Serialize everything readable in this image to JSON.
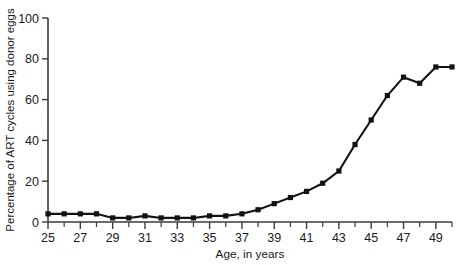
{
  "chart_data": {
    "type": "line",
    "title": "",
    "xlabel": "Age, in years",
    "ylabel": "Percentage of ART cycles using donor eggs",
    "xlim": [
      25,
      50
    ],
    "ylim": [
      0,
      100
    ],
    "xticks": [
      25,
      27,
      29,
      31,
      33,
      35,
      37,
      39,
      41,
      43,
      45,
      47,
      49
    ],
    "xtick_labels": [
      "25",
      "27",
      "29",
      "31",
      "33",
      "35",
      "37",
      "39",
      "41",
      "43",
      "45",
      "47",
      "49"
    ],
    "xminor_ticks": [
      26,
      28,
      30,
      32,
      34,
      36,
      38,
      40,
      42,
      44,
      46,
      48,
      50
    ],
    "yticks": [
      0,
      20,
      40,
      60,
      80,
      100
    ],
    "ytick_labels": [
      "0",
      "20",
      "40",
      "60",
      "80",
      "100"
    ],
    "grid": false,
    "legend": false,
    "marker": "square",
    "x": [
      25,
      26,
      27,
      28,
      29,
      30,
      31,
      32,
      33,
      34,
      35,
      36,
      37,
      38,
      39,
      40,
      41,
      42,
      43,
      44,
      45,
      46,
      47,
      48,
      49,
      50
    ],
    "values": [
      4,
      4,
      4,
      4,
      2,
      2,
      3,
      2,
      2,
      2,
      3,
      3,
      4,
      6,
      9,
      12,
      15,
      19,
      25,
      38,
      50,
      62,
      71,
      68,
      76,
      76
    ],
    "series": [
      {
        "name": "Percentage of ART cycles using donor eggs",
        "values": [
          4,
          4,
          4,
          4,
          2,
          2,
          3,
          2,
          2,
          2,
          3,
          3,
          4,
          6,
          9,
          12,
          15,
          19,
          25,
          38,
          50,
          62,
          71,
          68,
          76,
          76
        ]
      }
    ]
  },
  "style": {
    "line_color": "#121212",
    "axis_color": "#3b3b3b",
    "background": "#ffffff"
  }
}
